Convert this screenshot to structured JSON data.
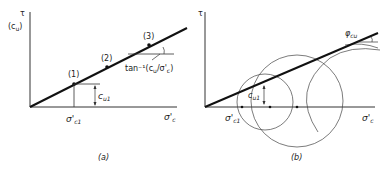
{
  "panel_a": {
    "y_axis_label": "τ",
    "y_axis_sub": "(c",
    "y_axis_sub_u": "u",
    "y_axis_close": ")",
    "x_axis_label": "σ'",
    "x_axis_sub": "c",
    "point_1": "(1)",
    "point_2": "(2)",
    "point_3": "(3)",
    "cu1_label": "c",
    "cu1_sub": "u1",
    "sigma_c1": "σ'",
    "sigma_c1_sub": "c1",
    "tan_label": "tan⁻¹(c",
    "tan_u": "u",
    "tan_mid": "/σ'",
    "tan_c": "c",
    "tan_close": ")",
    "caption": "(a)"
  },
  "panel_b": {
    "y_axis_label": "τ",
    "x_axis_label": "σ'",
    "x_axis_sub": "c",
    "phi_label": "φ",
    "phi_sub": "cu",
    "cu1_label": "c",
    "cu1_sub": "u1",
    "sigma_c1": "σ'",
    "sigma_c1_sub": "c1",
    "caption": "(b)"
  }
}
